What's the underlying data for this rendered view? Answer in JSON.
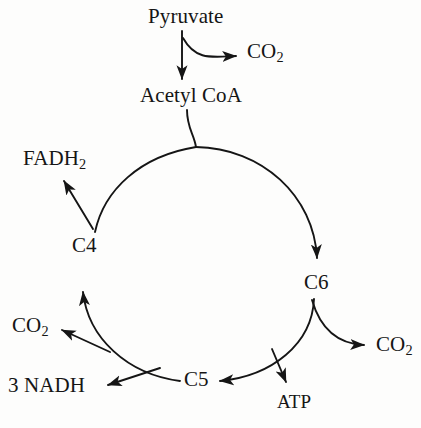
{
  "diagram": {
    "style": {
      "background_color": "#fdfdfc",
      "stroke_color": "#151515",
      "text_color": "#151515"
    },
    "nodes": {
      "pyruvate": "Pyruvate",
      "co2_top": "CO",
      "co2_top_sub": "2",
      "acetyl_coa": "Acetyl CoA",
      "fadh2": "FADH",
      "fadh2_sub": "2",
      "c4": "C4",
      "c6": "C6",
      "co2_left": "CO",
      "co2_left_sub": "2",
      "co2_right": "CO",
      "co2_right_sub": "2",
      "nadh": "3 NADH",
      "c5": "C5",
      "atp": "ATP"
    },
    "edges": [
      {
        "from": "Pyruvate",
        "to": "Acetyl CoA",
        "kind": "straight-arrow",
        "direction": "down"
      },
      {
        "from": "Pyruvate",
        "to": "CO2",
        "kind": "curved-arrow",
        "direction": "right"
      },
      {
        "from": "Acetyl CoA",
        "to": "cycle",
        "kind": "curve",
        "direction": "down"
      },
      {
        "from": "cycle-top",
        "to": "C6",
        "kind": "arc-arrow",
        "direction": "clockwise"
      },
      {
        "from": "C6",
        "to": "CO2",
        "kind": "curved-arrow",
        "direction": "right"
      },
      {
        "from": "C6",
        "to": "ATP",
        "kind": "straight-arrow",
        "direction": "down"
      },
      {
        "from": "C6",
        "to": "C5",
        "kind": "arc-arrow",
        "direction": "clockwise"
      },
      {
        "from": "C5",
        "to": "CO2",
        "kind": "straight-arrow",
        "direction": "up-left"
      },
      {
        "from": "C5",
        "to": "3 NADH",
        "kind": "straight-arrow",
        "direction": "left"
      },
      {
        "from": "C5",
        "to": "C4",
        "kind": "arc-arrow",
        "direction": "clockwise"
      },
      {
        "from": "C4",
        "to": "FADH2",
        "kind": "straight-arrow",
        "direction": "up-left"
      }
    ],
    "cycle": {
      "center_x": 200,
      "center_y": 265,
      "radius": 118
    }
  }
}
